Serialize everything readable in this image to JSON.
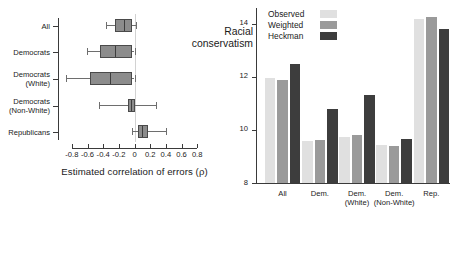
{
  "figure": {
    "title": "",
    "panels": [
      "box-plot-correlation-of-errors",
      "bar-chart-racial-conservatism"
    ]
  },
  "chart_data": [
    {
      "type": "box",
      "id": "left",
      "title": "",
      "xlabel": "Estimated correlation of errors (ρ)",
      "ylabel": "",
      "xlim": [
        -0.9,
        0.9
      ],
      "xticks": [
        -0.8,
        -0.6,
        -0.4,
        -0.2,
        0,
        0.2,
        0.4,
        0.6,
        0.8
      ],
      "xticklabels": [
        "-0.8",
        "-0.6",
        "-0.4",
        "-0.2",
        "0",
        "0.2",
        "0.4",
        "0.6",
        "0.8"
      ],
      "grid": false,
      "reference_line_x": 0,
      "categories": [
        "All",
        "Democrats",
        "Democrats (White)",
        "Democrats (Non-White)",
        "Republicans"
      ],
      "boxes": [
        {
          "category": "All",
          "whisker_low": -0.37,
          "q1": -0.25,
          "median": -0.14,
          "q3": -0.03,
          "whisker_high": 0.02
        },
        {
          "category": "Democrats",
          "whisker_low": -0.61,
          "q1": -0.44,
          "median": -0.25,
          "q3": -0.03,
          "whisker_high": 0.0
        },
        {
          "category": "Democrats (White)",
          "whisker_low": -0.87,
          "q1": -0.57,
          "median": -0.31,
          "q3": -0.03,
          "whisker_high": 0.0
        },
        {
          "category": "Democrats (Non-White)",
          "whisker_low": -0.45,
          "q1": -0.08,
          "median": -0.04,
          "q3": 0.01,
          "whisker_high": 0.27
        },
        {
          "category": "Republicans",
          "whisker_low": -0.03,
          "q1": 0.05,
          "median": 0.1,
          "q3": 0.17,
          "whisker_high": 0.4
        }
      ]
    },
    {
      "type": "bar",
      "id": "right",
      "title": "",
      "xlabel": "",
      "ylabel": "Racial conservatism",
      "ylim": [
        8,
        14.6
      ],
      "yticks": [
        8,
        10,
        12,
        14
      ],
      "yticklabels": [
        "8",
        "10",
        "12",
        "14"
      ],
      "grid": false,
      "legend_position": "top-left",
      "categories": [
        "All",
        "Dem.",
        "Dem. (White)",
        "Dem. (Non-White)",
        "Rep."
      ],
      "category_lines": [
        [
          "All"
        ],
        [
          "Dem."
        ],
        [
          "Dem.",
          "(White)"
        ],
        [
          "Dem.",
          "(Non-White)"
        ],
        [
          "Rep."
        ]
      ],
      "series": [
        {
          "name": "Observed",
          "color": "#e0e0e0",
          "values": [
            11.95,
            9.6,
            9.72,
            9.45,
            14.2
          ]
        },
        {
          "name": "Weighted",
          "color": "#9a9a9a",
          "values": [
            11.9,
            9.62,
            9.8,
            9.4,
            14.25
          ]
        },
        {
          "name": "Heckman",
          "color": "#3d3d3d",
          "values": [
            12.5,
            10.8,
            11.32,
            9.65,
            13.8
          ]
        }
      ]
    }
  ],
  "left": {
    "xlabel": "Estimated correlation of errors (ρ)",
    "xticklabels": [
      "-0.8",
      "-0.6",
      "-0.4",
      "-0.2",
      "0",
      "0.2",
      "0.4",
      "0.6",
      "0.8"
    ],
    "categories": [
      {
        "lines": [
          "All"
        ]
      },
      {
        "lines": [
          "Democrats"
        ]
      },
      {
        "lines": [
          "Democrats",
          "(White)"
        ]
      },
      {
        "lines": [
          "Democrats",
          "(Non-White)"
        ]
      },
      {
        "lines": [
          "Republicans"
        ]
      }
    ]
  },
  "right": {
    "ylabel_lines": [
      "Racial",
      "conservatism"
    ],
    "yticklabels": [
      "14",
      "12",
      "10",
      "8"
    ],
    "legend": [
      {
        "label": "Observed",
        "color": "#e0e0e0"
      },
      {
        "label": "Weighted",
        "color": "#9a9a9a"
      },
      {
        "label": "Heckman",
        "color": "#3d3d3d"
      }
    ],
    "groups": [
      {
        "line1": "All",
        "line2": ""
      },
      {
        "line1": "Dem.",
        "line2": ""
      },
      {
        "line1": "Dem.",
        "line2": "(White)"
      },
      {
        "line1": "Dem.",
        "line2": "(Non-White)"
      },
      {
        "line1": "Rep.",
        "line2": ""
      }
    ]
  },
  "colors": {
    "box_fill": "#8c8c8c",
    "box_edge": "#4a4a4a",
    "whisker": "#6e6e6e",
    "axis": "#3a3a3a",
    "reference": "#d2d2d2",
    "observed": "#e0e0e0",
    "weighted": "#9a9a9a",
    "heckman": "#3d3d3d"
  }
}
